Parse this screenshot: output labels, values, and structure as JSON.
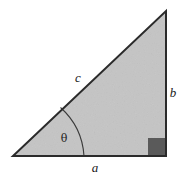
{
  "figure": {
    "background_color": "#ffffff",
    "width": 182,
    "height": 178
  },
  "triangle": {
    "fill_color": "#c5c5c5",
    "stroke_color": "#2b2b2b",
    "stroke_width": 2,
    "vertices": {
      "bottom_left": [
        13,
        156
      ],
      "bottom_right": [
        166,
        156
      ],
      "top_right": [
        166,
        11
      ]
    }
  },
  "labels": {
    "hypotenuse": "c",
    "vertical_leg": "b",
    "horizontal_leg": "a",
    "angle": "θ"
  },
  "label_positions": {
    "hypotenuse": [
      78,
      77
    ],
    "vertical_leg": [
      173,
      92
    ],
    "horizontal_leg": [
      95,
      167
    ],
    "angle": [
      64,
      138
    ]
  },
  "markers": {
    "right_angle": {
      "name": "right-angle-square",
      "fill_color": "#5a5a5a",
      "x": 148,
      "y": 138,
      "size": 18
    },
    "angle_arc": {
      "name": "theta-angle-arc",
      "stroke_color": "#3a3a3a",
      "stroke_width": 1.1,
      "radius": 71,
      "start": [
        60,
        108
      ],
      "end": [
        84,
        156
      ]
    }
  }
}
